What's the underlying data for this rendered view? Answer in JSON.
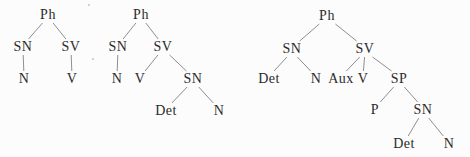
{
  "figure": {
    "background_color": "#fcfcfc",
    "text_color": "#2b2b2b",
    "line_color": "#8f8f8f",
    "trees": [
      {
        "name": "tree-1",
        "nodes": [
          {
            "id": "ph",
            "label": "Ph",
            "x": 48,
            "y": 15
          },
          {
            "id": "sn",
            "label": "SN",
            "x": 23,
            "y": 47
          },
          {
            "id": "sv",
            "label": "SV",
            "x": 71,
            "y": 47
          },
          {
            "id": "n",
            "label": "N",
            "x": 24,
            "y": 79
          },
          {
            "id": "v",
            "label": "V",
            "x": 72,
            "y": 79
          }
        ],
        "edges": [
          [
            "ph",
            "sn"
          ],
          [
            "ph",
            "sv"
          ],
          [
            "sn",
            "n"
          ],
          [
            "sv",
            "v"
          ]
        ]
      },
      {
        "name": "tree-2",
        "nodes": [
          {
            "id": "ph",
            "label": "Ph",
            "x": 141,
            "y": 15
          },
          {
            "id": "sn",
            "label": "SN",
            "x": 118,
            "y": 47
          },
          {
            "id": "sv",
            "label": "SV",
            "x": 163,
            "y": 47
          },
          {
            "id": "n",
            "label": "N",
            "x": 117,
            "y": 79
          },
          {
            "id": "v",
            "label": "V",
            "x": 140,
            "y": 79
          },
          {
            "id": "sn2",
            "label": "SN",
            "x": 193,
            "y": 79
          },
          {
            "id": "det",
            "label": "Det",
            "x": 166,
            "y": 111
          },
          {
            "id": "n2",
            "label": "N",
            "x": 219,
            "y": 111
          }
        ],
        "edges": [
          [
            "ph",
            "sn"
          ],
          [
            "ph",
            "sv"
          ],
          [
            "sn",
            "n"
          ],
          [
            "sv",
            "v"
          ],
          [
            "sv",
            "sn2"
          ],
          [
            "sn2",
            "det"
          ],
          [
            "sn2",
            "n2"
          ]
        ]
      },
      {
        "name": "tree-3",
        "nodes": [
          {
            "id": "ph",
            "label": "Ph",
            "x": 327,
            "y": 16
          },
          {
            "id": "sn",
            "label": "SN",
            "x": 292,
            "y": 49
          },
          {
            "id": "sv",
            "label": "SV",
            "x": 365,
            "y": 49
          },
          {
            "id": "det",
            "label": "Det",
            "x": 269,
            "y": 79
          },
          {
            "id": "n",
            "label": "N",
            "x": 316,
            "y": 79
          },
          {
            "id": "aux",
            "label": "Aux",
            "x": 341,
            "y": 79
          },
          {
            "id": "v",
            "label": "V",
            "x": 363,
            "y": 79
          },
          {
            "id": "sp",
            "label": "SP",
            "x": 399,
            "y": 79
          },
          {
            "id": "p",
            "label": "P",
            "x": 375,
            "y": 110
          },
          {
            "id": "sn2",
            "label": "SN",
            "x": 423,
            "y": 110
          },
          {
            "id": "det2",
            "label": "Det",
            "x": 404,
            "y": 144
          },
          {
            "id": "n2",
            "label": "N",
            "x": 449,
            "y": 144
          }
        ],
        "edges": [
          [
            "ph",
            "sn"
          ],
          [
            "ph",
            "sv"
          ],
          [
            "sn",
            "det"
          ],
          [
            "sn",
            "n"
          ],
          [
            "sv",
            "aux"
          ],
          [
            "sv",
            "v"
          ],
          [
            "sv",
            "sp"
          ],
          [
            "sp",
            "p"
          ],
          [
            "sp",
            "sn2"
          ],
          [
            "sn2",
            "det2"
          ],
          [
            "sn2",
            "n2"
          ]
        ]
      }
    ],
    "artifacts": [
      {
        "x": 88,
        "y": 4
      },
      {
        "x": 92,
        "y": 58
      }
    ]
  }
}
